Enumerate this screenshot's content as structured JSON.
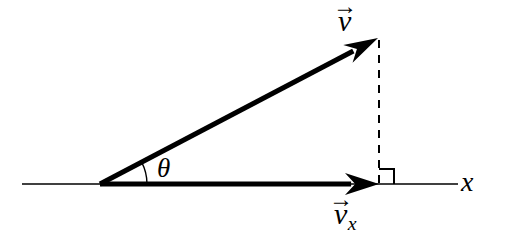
{
  "figure": {
    "background_color": "#ffffff",
    "ink_color": "#000000",
    "width": 506,
    "height": 247
  },
  "labels": {
    "vector_v": {
      "symbol": "v",
      "accent": "→",
      "subscript": "",
      "name": "vector-v-label"
    },
    "vector_vx": {
      "symbol": "v",
      "accent": "→",
      "subscript": "x",
      "name": "vector-vx-label"
    },
    "axis_x": {
      "text": "x",
      "name": "x-axis-label"
    },
    "angle_theta": {
      "text": "θ",
      "name": "theta-label"
    }
  },
  "geometry": {
    "origin": {
      "x": 100,
      "y": 184
    },
    "axis_line": {
      "x1": 22,
      "y1": 184,
      "x2": 458,
      "y2": 184,
      "stroke_width": 1.6
    },
    "vector_v": {
      "x1": 100,
      "y1": 184,
      "x2": 378,
      "y2": 38,
      "stroke_width": 5,
      "arrowhead_length": 34,
      "arrowhead_width": 20,
      "angle_degrees": 27.7
    },
    "vector_vx": {
      "x1": 100,
      "y1": 184,
      "x2": 379,
      "y2": 184,
      "stroke_width": 5,
      "arrowhead_length": 34,
      "arrowhead_width": 22,
      "angle_degrees": 0
    },
    "projection_dashed_line": {
      "x1": 379,
      "y1": 40,
      "x2": 379,
      "y2": 184,
      "stroke_width": 2,
      "dash_pattern": "8 7"
    },
    "right_angle_marker": {
      "corner_x": 379,
      "corner_y": 184,
      "size": 15,
      "stroke_width": 2,
      "opens": "up-right"
    },
    "angle_arc": {
      "center_x": 100,
      "center_y": 184,
      "radius": 47,
      "start_angle_degrees": 0,
      "end_angle_degrees": 27.7,
      "stroke_width": 1.4
    }
  }
}
